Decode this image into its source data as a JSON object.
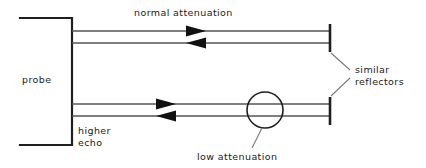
{
  "diagram": {
    "canvas": {
      "width": 426,
      "height": 168,
      "background": "#ffffff"
    },
    "colors": {
      "outline": "#1f1f1f",
      "beam_line": "#555555",
      "leader_line": "#7a7a7a",
      "arrow_fill": "#111111",
      "text": "#1a1a1a"
    },
    "labels": {
      "probe": "probe",
      "normal_attenuation": "normal attenuation",
      "higher_echo_line1": "higher",
      "higher_echo_line2": "echo",
      "similar_reflectors_line1": "similar",
      "similar_reflectors_line2": "reflectors",
      "low_attenuation": "low attenuation"
    },
    "components": {
      "probe_block": {
        "name": "probe",
        "shape": "open-left-rectangle",
        "x": 20,
        "y": 18,
        "width": 52,
        "height": 127
      },
      "upper_beam": {
        "name": "normal attenuation beam path",
        "outgoing_y": 31,
        "returning_y": 43,
        "x_start": 72,
        "x_end": 330,
        "outgoing_direction": "right",
        "returning_direction": "left"
      },
      "lower_beam": {
        "name": "low attenuation beam path",
        "outgoing_y": 104,
        "returning_y": 116,
        "x_start": 72,
        "x_end": 330,
        "outgoing_direction": "right",
        "returning_direction": "left"
      },
      "upper_reflector": {
        "name": "similar reflector (top)",
        "x": 330,
        "y_top": 24,
        "y_bottom": 52
      },
      "lower_reflector": {
        "name": "similar reflector (bottom)",
        "x": 330,
        "y_top": 97,
        "y_bottom": 125
      },
      "attenuator_circle": {
        "name": "low attenuation region",
        "cx": 265,
        "cy": 110,
        "r": 18
      }
    }
  }
}
